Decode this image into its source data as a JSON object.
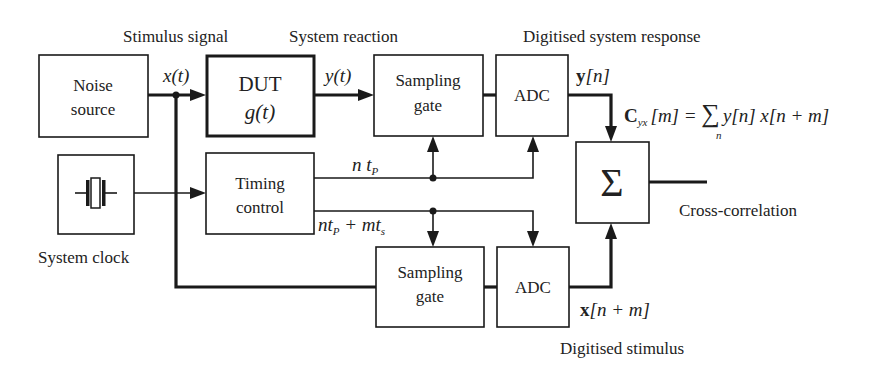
{
  "diagram": {
    "title_labels": {
      "stimulus_signal": "Stimulus signal",
      "system_reaction": "System reaction",
      "digitised_system_response": "Digitised  system response",
      "digitised_stimulus": "Digitised  stimulus",
      "cross_correlation": "Cross-correlation",
      "system_clock": "System clock"
    },
    "blocks": {
      "noise_source": {
        "line1": "Noise",
        "line2": "source"
      },
      "dut": {
        "line1": "DUT",
        "line2": "g(t)"
      },
      "sampling_gate_top": {
        "line1": "Sampling",
        "line2": "gate"
      },
      "adc_top": {
        "label": "ADC"
      },
      "timing_control": {
        "line1": "Timing",
        "line2": "control"
      },
      "sampling_gate_bottom": {
        "line1": "Sampling",
        "line2": "gate"
      },
      "adc_bottom": {
        "label": "ADC"
      },
      "summer": {
        "label": "Σ"
      },
      "system_clock": {
        "icon": "crystal-oscillator-icon"
      }
    },
    "signals": {
      "x_t": "x(t)",
      "y_t": "y(t)",
      "y_n_bold": "y",
      "y_n_index": "[n]",
      "x_nm_bold": "x",
      "x_nm_index": "[n + m]",
      "n_tp_main": "n t",
      "n_tp_sub": "P",
      "ntp_mts_main1": "nt",
      "ntp_mts_sub1": "P",
      "ntp_mts_main2": " + mt",
      "ntp_mts_sub2": "s"
    },
    "equation": {
      "lhs_bold": "C",
      "lhs_sub": "yx",
      "lhs_arg": "[m] = ",
      "sum_symbol": "∑",
      "sum_index": "n",
      "rhs": "y[n] x[n + m]"
    }
  }
}
